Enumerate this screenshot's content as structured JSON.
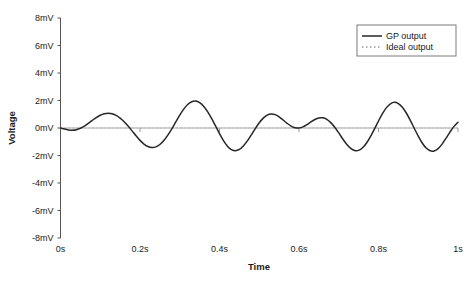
{
  "chart_data": {
    "type": "line",
    "title": "",
    "xlabel": "Time",
    "ylabel": "Voltage",
    "xlim": [
      0,
      1
    ],
    "ylim": [
      -8,
      8
    ],
    "grid": false,
    "legend_position": "top-right",
    "x_tick_labels": [
      "0s",
      "0.2s",
      "0.4s",
      "0.6s",
      "0.8s",
      "1s"
    ],
    "x_tick_values": [
      0,
      0.2,
      0.4,
      0.6,
      0.8,
      1
    ],
    "y_tick_labels": [
      "8mV",
      "6mV",
      "4mV",
      "2mV",
      "0mV",
      "-2mV",
      "-4mV",
      "-6mV",
      "-8mV"
    ],
    "y_tick_values": [
      8,
      6,
      4,
      2,
      0,
      -2,
      -4,
      -6,
      -8
    ],
    "series": [
      {
        "name": "GP output",
        "style": "solid",
        "color": "#262626",
        "x": [
          0.0,
          0.01,
          0.02,
          0.03,
          0.04,
          0.05,
          0.06,
          0.07,
          0.08,
          0.09,
          0.1,
          0.11,
          0.12,
          0.13,
          0.14,
          0.15,
          0.16,
          0.17,
          0.18,
          0.19,
          0.2,
          0.21,
          0.22,
          0.23,
          0.24,
          0.25,
          0.26,
          0.27,
          0.28,
          0.29,
          0.3,
          0.31,
          0.32,
          0.33,
          0.34,
          0.35,
          0.36,
          0.37,
          0.38,
          0.39,
          0.4,
          0.41,
          0.42,
          0.43,
          0.44,
          0.45,
          0.46,
          0.47,
          0.48,
          0.49,
          0.5,
          0.51,
          0.52,
          0.53,
          0.54,
          0.55,
          0.56,
          0.57,
          0.58,
          0.59,
          0.6,
          0.61,
          0.62,
          0.63,
          0.64,
          0.65,
          0.66,
          0.67,
          0.68,
          0.69,
          0.7,
          0.71,
          0.72,
          0.73,
          0.74,
          0.75,
          0.76,
          0.77,
          0.78,
          0.79,
          0.8,
          0.81,
          0.82,
          0.83,
          0.84,
          0.85,
          0.86,
          0.87,
          0.88,
          0.89,
          0.9,
          0.91,
          0.92,
          0.93,
          0.94,
          0.95,
          0.96,
          0.97,
          0.98,
          0.99,
          1.0
        ],
        "y": [
          0.0,
          -0.08,
          -0.14,
          -0.16,
          -0.12,
          -0.02,
          0.14,
          0.34,
          0.55,
          0.76,
          0.93,
          1.04,
          1.08,
          1.04,
          0.92,
          0.72,
          0.46,
          0.14,
          -0.21,
          -0.57,
          -0.9,
          -1.17,
          -1.35,
          -1.42,
          -1.37,
          -1.2,
          -0.91,
          -0.52,
          -0.06,
          0.44,
          0.93,
          1.37,
          1.71,
          1.91,
          1.96,
          1.85,
          1.59,
          1.19,
          0.7,
          0.15,
          -0.41,
          -0.92,
          -1.32,
          -1.57,
          -1.65,
          -1.56,
          -1.31,
          -0.94,
          -0.5,
          -0.04,
          0.38,
          0.72,
          0.94,
          1.02,
          0.97,
          0.81,
          0.58,
          0.34,
          0.14,
          0.02,
          0.0,
          0.08,
          0.24,
          0.44,
          0.62,
          0.73,
          0.74,
          0.63,
          0.39,
          0.05,
          -0.36,
          -0.79,
          -1.18,
          -1.48,
          -1.64,
          -1.63,
          -1.44,
          -1.09,
          -0.61,
          -0.06,
          0.51,
          1.04,
          1.48,
          1.76,
          1.87,
          1.78,
          1.51,
          1.09,
          0.56,
          -0.02,
          -0.59,
          -1.09,
          -1.46,
          -1.66,
          -1.67,
          -1.5,
          -1.17,
          -0.74,
          -0.29,
          0.12,
          0.42
        ]
      },
      {
        "name": "Ideal output",
        "style": "dotted",
        "color": "#9a9a9a",
        "x": [
          0,
          1
        ],
        "y": [
          0,
          0
        ]
      }
    ]
  },
  "legend": {
    "items": [
      {
        "label": "GP output",
        "style": "solid"
      },
      {
        "label": "Ideal output",
        "style": "dotted"
      }
    ]
  },
  "axes": {
    "x_title": "Time",
    "y_title": "Voltage"
  }
}
